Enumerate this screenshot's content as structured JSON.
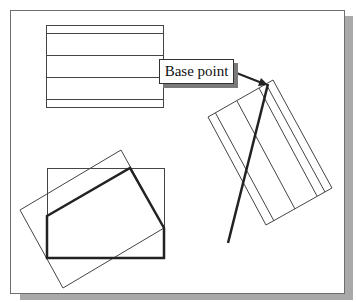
{
  "diagram": {
    "callout": {
      "label": "Base point"
    },
    "colors": {
      "stroke": "#333333",
      "thick_stroke": "#222222",
      "frame": "#6e6e6e",
      "shadow": "#a9a9a9",
      "background": "#ffffff"
    },
    "shapes": {
      "top_left_rect": {
        "x": 46,
        "y": 25,
        "w": 117,
        "h": 82,
        "hatch_lines_y": [
          33,
          55,
          77,
          99
        ]
      },
      "rotated_rect_right": {
        "corners": [
          [
            273,
            80
          ],
          [
            332,
            188
          ],
          [
            266,
            225
          ],
          [
            208,
            117
          ]
        ]
      },
      "thick_line": {
        "from": [
          268,
          84
        ],
        "to": [
          228,
          243
        ]
      },
      "bottom_left_rect": {
        "x": 47,
        "y": 168,
        "w": 117,
        "h": 90
      },
      "rotated_rect_left": {
        "corners": [
          [
            121,
            150
          ],
          [
            164,
            228
          ],
          [
            63,
            288
          ],
          [
            20,
            210
          ]
        ]
      },
      "thick_polygon": {
        "points": [
          [
            47,
            216
          ],
          [
            130,
            168
          ],
          [
            164,
            228
          ],
          [
            164,
            258
          ],
          [
            47,
            258
          ]
        ]
      }
    }
  }
}
